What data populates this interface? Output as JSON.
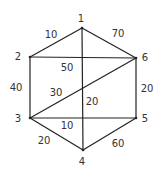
{
  "diagram": {
    "type": "weighted-undirected-graph",
    "nodes": [
      {
        "id": "1",
        "label": "1",
        "x": 82,
        "y": 28,
        "lx": 81,
        "ly": 18
      },
      {
        "id": "2",
        "label": "2",
        "x": 30,
        "y": 57,
        "lx": 18,
        "ly": 56
      },
      {
        "id": "3",
        "label": "3",
        "x": 30,
        "y": 118,
        "lx": 18,
        "ly": 118
      },
      {
        "id": "4",
        "label": "4",
        "x": 83,
        "y": 150,
        "lx": 82,
        "ly": 161
      },
      {
        "id": "5",
        "label": "5",
        "x": 136,
        "y": 118,
        "lx": 145,
        "ly": 118
      },
      {
        "id": "6",
        "label": "6",
        "x": 136,
        "y": 58,
        "lx": 145,
        "ly": 57
      }
    ],
    "edges": [
      {
        "from": "1",
        "to": "2",
        "weight": "10",
        "lx": 51,
        "ly": 34
      },
      {
        "from": "1",
        "to": "6",
        "weight": "70",
        "lx": 118,
        "ly": 33
      },
      {
        "from": "2",
        "to": "6",
        "weight": "50",
        "lx": 67,
        "ly": 67
      },
      {
        "from": "2",
        "to": "3",
        "weight": "40",
        "lx": 16,
        "ly": 87
      },
      {
        "from": "3",
        "to": "6",
        "weight": "30",
        "lx": 56,
        "ly": 92
      },
      {
        "from": "1",
        "to": "4",
        "weight": "20",
        "lx": 92,
        "ly": 101
      },
      {
        "from": "6",
        "to": "5",
        "weight": "20",
        "lx": 147,
        "ly": 88
      },
      {
        "from": "3",
        "to": "5",
        "weight": "10",
        "lx": 67,
        "ly": 125
      },
      {
        "from": "3",
        "to": "4",
        "weight": "20",
        "lx": 44,
        "ly": 140
      },
      {
        "from": "4",
        "to": "5",
        "weight": "60",
        "lx": 118,
        "ly": 143
      }
    ]
  }
}
